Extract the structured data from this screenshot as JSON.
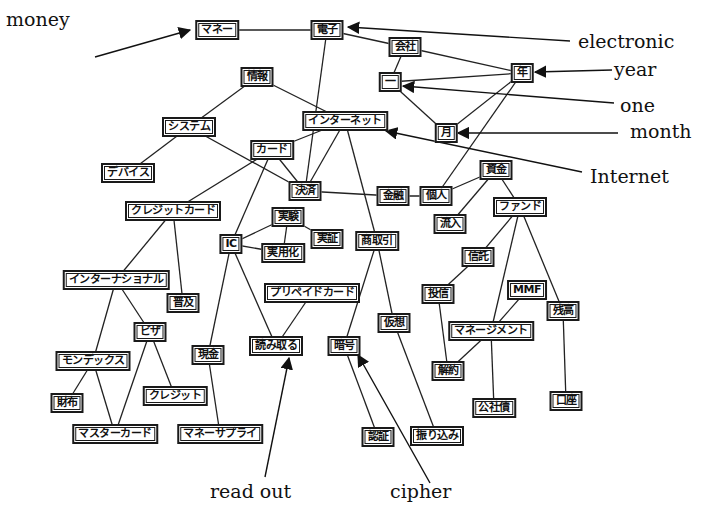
{
  "diagram": {
    "nodes": [
      {
        "id": "money_jp",
        "text": "マネー",
        "x": 217,
        "y": 30
      },
      {
        "id": "denshi",
        "text": "電子",
        "x": 327,
        "y": 30
      },
      {
        "id": "kaisha",
        "text": "会社",
        "x": 405,
        "y": 47
      },
      {
        "id": "ichi",
        "text": "一",
        "x": 390,
        "y": 82
      },
      {
        "id": "nen",
        "text": "年",
        "x": 522,
        "y": 73
      },
      {
        "id": "tsuki",
        "text": "月",
        "x": 446,
        "y": 133
      },
      {
        "id": "jouhou",
        "text": "情報",
        "x": 257,
        "y": 77
      },
      {
        "id": "internet",
        "text": "インターネット",
        "x": 345,
        "y": 121
      },
      {
        "id": "system",
        "text": "システム",
        "x": 189,
        "y": 127
      },
      {
        "id": "card",
        "text": "カード",
        "x": 272,
        "y": 150
      },
      {
        "id": "device",
        "text": "デバイス",
        "x": 128,
        "y": 173
      },
      {
        "id": "kessai",
        "text": "決済",
        "x": 305,
        "y": 191
      },
      {
        "id": "kinyu",
        "text": "金融",
        "x": 393,
        "y": 196
      },
      {
        "id": "kojin",
        "text": "個人",
        "x": 436,
        "y": 196
      },
      {
        "id": "shikin",
        "text": "資金",
        "x": 496,
        "y": 170
      },
      {
        "id": "fund",
        "text": "ファンド",
        "x": 520,
        "y": 207
      },
      {
        "id": "ryunyu",
        "text": "流入",
        "x": 450,
        "y": 224
      },
      {
        "id": "creditcard",
        "text": "クレジットカード",
        "x": 173,
        "y": 211
      },
      {
        "id": "jikken",
        "text": "実験",
        "x": 288,
        "y": 217
      },
      {
        "id": "jisshou",
        "text": "実証",
        "x": 327,
        "y": 239
      },
      {
        "id": "ic",
        "text": "IC",
        "x": 231,
        "y": 244
      },
      {
        "id": "jitsuyouka",
        "text": "実用化",
        "x": 283,
        "y": 253
      },
      {
        "id": "shoutorihiki",
        "text": "商取引",
        "x": 377,
        "y": 241
      },
      {
        "id": "shintaku",
        "text": "信託",
        "x": 478,
        "y": 257
      },
      {
        "id": "international",
        "text": "インターナショナル",
        "x": 116,
        "y": 280
      },
      {
        "id": "prepaid",
        "text": "プリペイドカード",
        "x": 312,
        "y": 293
      },
      {
        "id": "toushin",
        "text": "投信",
        "x": 438,
        "y": 294
      },
      {
        "id": "mmf",
        "text": "MMF",
        "x": 527,
        "y": 290
      },
      {
        "id": "zandaka",
        "text": "残高",
        "x": 563,
        "y": 311
      },
      {
        "id": "fukyu",
        "text": "普及",
        "x": 183,
        "y": 303
      },
      {
        "id": "kasou",
        "text": "仮想",
        "x": 394,
        "y": 323
      },
      {
        "id": "management",
        "text": "マネージメント",
        "x": 491,
        "y": 331
      },
      {
        "id": "visa",
        "text": "ビザ",
        "x": 150,
        "y": 332
      },
      {
        "id": "genkin",
        "text": "現金",
        "x": 208,
        "y": 355
      },
      {
        "id": "yomitoru",
        "text": "読み取る",
        "x": 276,
        "y": 346
      },
      {
        "id": "angou",
        "text": "暗号",
        "x": 344,
        "y": 346
      },
      {
        "id": "mondex",
        "text": "モンデックス",
        "x": 93,
        "y": 361
      },
      {
        "id": "kaiyaku",
        "text": "解約",
        "x": 448,
        "y": 371
      },
      {
        "id": "saifu",
        "text": "財布",
        "x": 67,
        "y": 403
      },
      {
        "id": "credit",
        "text": "クレジット",
        "x": 175,
        "y": 396
      },
      {
        "id": "koushasai",
        "text": "公社債",
        "x": 494,
        "y": 408
      },
      {
        "id": "kouza",
        "text": "口座",
        "x": 566,
        "y": 401
      },
      {
        "id": "mastercard",
        "text": "マスターカード",
        "x": 115,
        "y": 434
      },
      {
        "id": "moneysupply",
        "text": "マネーサプライ",
        "x": 220,
        "y": 434
      },
      {
        "id": "ninshou",
        "text": "認証",
        "x": 378,
        "y": 437
      },
      {
        "id": "furikomi",
        "text": "振り込み",
        "x": 437,
        "y": 436
      }
    ],
    "edges": [
      [
        "money_jp",
        "denshi"
      ],
      [
        "denshi",
        "kaisha"
      ],
      [
        "denshi",
        "kessai"
      ],
      [
        "kaisha",
        "ichi"
      ],
      [
        "kaisha",
        "nen"
      ],
      [
        "nen",
        "ichi"
      ],
      [
        "ichi",
        "tsuki"
      ],
      [
        "nen",
        "tsuki"
      ],
      [
        "nen",
        "kojin"
      ],
      [
        "jouhou",
        "system"
      ],
      [
        "jouhou",
        "internet"
      ],
      [
        "system",
        "device"
      ],
      [
        "system",
        "kessai"
      ],
      [
        "internet",
        "card"
      ],
      [
        "internet",
        "kessai"
      ],
      [
        "internet",
        "shoutorihiki"
      ],
      [
        "card",
        "kessai"
      ],
      [
        "card",
        "creditcard"
      ],
      [
        "card",
        "ic"
      ],
      [
        "kessai",
        "kinyu"
      ],
      [
        "kinyu",
        "kojin"
      ],
      [
        "kojin",
        "shikin"
      ],
      [
        "shikin",
        "ryunyu"
      ],
      [
        "shikin",
        "fund"
      ],
      [
        "fund",
        "shintaku"
      ],
      [
        "fund",
        "management"
      ],
      [
        "fund",
        "zandaka"
      ],
      [
        "shintaku",
        "toushin"
      ],
      [
        "toushin",
        "kaiyaku"
      ],
      [
        "mmf",
        "management"
      ],
      [
        "management",
        "kaiyaku"
      ],
      [
        "management",
        "koushasai"
      ],
      [
        "zandaka",
        "kouza"
      ],
      [
        "creditcard",
        "international"
      ],
      [
        "creditcard",
        "fukyu"
      ],
      [
        "ic",
        "jikken"
      ],
      [
        "ic",
        "jitsuyouka"
      ],
      [
        "jikken",
        "jitsuyouka"
      ],
      [
        "jikken",
        "jisshou"
      ],
      [
        "ic",
        "genkin"
      ],
      [
        "ic",
        "yomitoru"
      ],
      [
        "prepaid",
        "yomitoru"
      ],
      [
        "shoutorihiki",
        "angou"
      ],
      [
        "shoutorihiki",
        "kasou"
      ],
      [
        "kasou",
        "furikomi"
      ],
      [
        "angou",
        "ninshou"
      ],
      [
        "international",
        "mondex"
      ],
      [
        "international",
        "visa"
      ],
      [
        "visa",
        "mastercard"
      ],
      [
        "visa",
        "credit"
      ],
      [
        "mondex",
        "saifu"
      ],
      [
        "mondex",
        "mastercard"
      ],
      [
        "genkin",
        "moneysupply"
      ]
    ],
    "annotations": [
      {
        "id": "money",
        "text": "money",
        "x": 6,
        "y": 8,
        "ax1": 95,
        "ay1": 57,
        "ax2": 190,
        "ay2": 30
      },
      {
        "id": "electronic",
        "text": "electronic",
        "x": 578,
        "y": 30,
        "ax1": 570,
        "ay1": 41,
        "ax2": 348,
        "ay2": 27
      },
      {
        "id": "year",
        "text": "year",
        "x": 614,
        "y": 58,
        "ax1": 612,
        "ay1": 70,
        "ax2": 535,
        "ay2": 72
      },
      {
        "id": "one",
        "text": "one",
        "x": 620,
        "y": 94,
        "ax1": 614,
        "ay1": 103,
        "ax2": 403,
        "ay2": 86
      },
      {
        "id": "month",
        "text": "month",
        "x": 630,
        "y": 120,
        "ax1": 618,
        "ay1": 133,
        "ax2": 458,
        "ay2": 133
      },
      {
        "id": "internet_en",
        "text": "Internet",
        "x": 590,
        "y": 165,
        "ax1": 582,
        "ay1": 172,
        "ax2": 386,
        "ay2": 131
      },
      {
        "id": "readout",
        "text": "read out",
        "x": 210,
        "y": 480,
        "ax1": 265,
        "ay1": 477,
        "ax2": 289,
        "ay2": 358
      },
      {
        "id": "cipher",
        "text": "cipher",
        "x": 390,
        "y": 480,
        "ax1": 430,
        "ay1": 483,
        "ax2": 358,
        "ay2": 355
      }
    ]
  }
}
